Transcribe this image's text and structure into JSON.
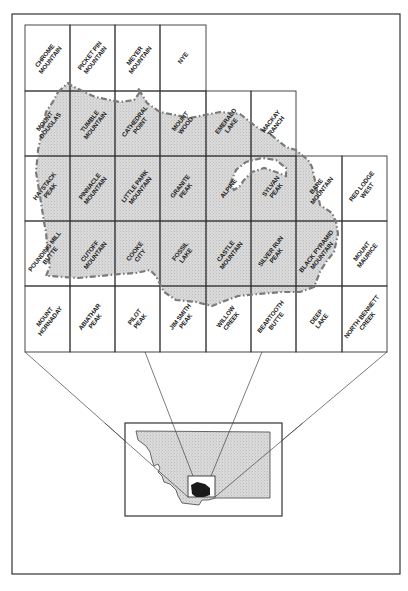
{
  "figure": {
    "outer_frame": {
      "x": 12,
      "y": 14,
      "w": 388,
      "h": 560
    },
    "colors": {
      "line": "#333333",
      "shade": "#d6d6d6",
      "boundary": "#7a7a7a",
      "highlight": "#1a1a1a",
      "paper": "#ffffff"
    }
  },
  "grid": {
    "col_x": [
      25,
      70,
      115,
      160,
      206,
      251,
      296,
      342,
      387
    ],
    "row_y": [
      25,
      91,
      156,
      221,
      286,
      352
    ],
    "cells": [
      {
        "row": 0,
        "col": 0,
        "lines": [
          "CHROME",
          "MOUNTAIN"
        ]
      },
      {
        "row": 0,
        "col": 1,
        "lines": [
          "PICKET PIN",
          "MOUNTAIN"
        ]
      },
      {
        "row": 0,
        "col": 2,
        "lines": [
          "MEYER",
          "MOUNTAIN"
        ]
      },
      {
        "row": 0,
        "col": 3,
        "lines": [
          "NYE"
        ]
      },
      {
        "row": 1,
        "col": 0,
        "lines": [
          "MOUNT",
          "DOUGLAS"
        ]
      },
      {
        "row": 1,
        "col": 1,
        "lines": [
          "TUMBLE",
          "MOUNTAIN"
        ]
      },
      {
        "row": 1,
        "col": 2,
        "lines": [
          "CATHEDRAL",
          "POINT"
        ]
      },
      {
        "row": 1,
        "col": 3,
        "lines": [
          "MOUNT",
          "WOOD"
        ]
      },
      {
        "row": 1,
        "col": 4,
        "lines": [
          "EMERALD",
          "LAKE"
        ]
      },
      {
        "row": 1,
        "col": 5,
        "lines": [
          "MACKAY",
          "RANCH"
        ]
      },
      {
        "row": 2,
        "col": 0,
        "lines": [
          "HAYSTACK",
          "PEAK"
        ]
      },
      {
        "row": 2,
        "col": 1,
        "lines": [
          "PINNACLE",
          "MOUNTAIN"
        ]
      },
      {
        "row": 2,
        "col": 2,
        "lines": [
          "LITTLE PARK",
          "MOUNTAIN"
        ]
      },
      {
        "row": 2,
        "col": 3,
        "lines": [
          "GRANITE",
          "PEAK"
        ]
      },
      {
        "row": 2,
        "col": 4,
        "lines": [
          "ALPINE"
        ]
      },
      {
        "row": 2,
        "col": 5,
        "lines": [
          "SYLVAN",
          "PEAK"
        ]
      },
      {
        "row": 2,
        "col": 6,
        "lines": [
          "BARE",
          "MOUNTAIN"
        ]
      },
      {
        "row": 2,
        "col": 7,
        "lines": [
          "RED LODGE",
          "WEST"
        ]
      },
      {
        "row": 3,
        "col": 0,
        "lines": [
          "POUNDING MILL",
          "BUTTE"
        ]
      },
      {
        "row": 3,
        "col": 1,
        "lines": [
          "CUTOFF",
          "MOUNTAIN"
        ]
      },
      {
        "row": 3,
        "col": 2,
        "lines": [
          "COOKE",
          "CITY"
        ]
      },
      {
        "row": 3,
        "col": 3,
        "lines": [
          "FOSSIL",
          "LAKE"
        ]
      },
      {
        "row": 3,
        "col": 4,
        "lines": [
          "CASTLE",
          "MOUNTAIN"
        ]
      },
      {
        "row": 3,
        "col": 5,
        "lines": [
          "SILVER RUN",
          "PEAK"
        ]
      },
      {
        "row": 3,
        "col": 6,
        "lines": [
          "BLACK PYRAMID",
          "MOUNTAIN"
        ]
      },
      {
        "row": 3,
        "col": 7,
        "lines": [
          "MOUNT",
          "MAURICE"
        ]
      },
      {
        "row": 4,
        "col": 0,
        "lines": [
          "MOUNT",
          "HORNADAY"
        ]
      },
      {
        "row": 4,
        "col": 1,
        "lines": [
          "ABIATHAR",
          "PEAK"
        ]
      },
      {
        "row": 4,
        "col": 2,
        "lines": [
          "PILOT",
          "PEAK"
        ]
      },
      {
        "row": 4,
        "col": 3,
        "lines": [
          "JIM SMITH",
          "PEAK"
        ]
      },
      {
        "row": 4,
        "col": 4,
        "lines": [
          "WILLOW",
          "CREEK"
        ]
      },
      {
        "row": 4,
        "col": 5,
        "lines": [
          "BEARTOOTH",
          "BUTTE"
        ]
      },
      {
        "row": 4,
        "col": 6,
        "lines": [
          "DEEP",
          "LAKE"
        ]
      },
      {
        "row": 4,
        "col": 7,
        "lines": [
          "NORTH BENNETT",
          "CREEK"
        ]
      }
    ]
  },
  "study_area": {
    "description": "Shaded area enclosed by dash-dot boundary line",
    "points": "58,92 68,83 72,86 95,97 120,102 134,100 140,92 138,88 147,103 160,112 190,118 220,112 240,114 258,128 270,134 286,147 296,150 303,156 308,160 312,167 314,176 320,205 332,213 336,222 338,234 334,252 326,262 320,272 314,287 300,292 282,292 258,294 238,296 222,302 212,306 196,302 176,300 170,296 164,292 160,284 156,276 150,270 136,273 120,274 100,276 78,278 50,276 46,276 50,266 48,256 46,232 44,222 40,196 36,172 38,150 42,132 46,112 54,100",
    "inclusion": "230,184 236,170 246,162 262,158 276,160 286,168 286,176 276,172 264,168 252,172 244,180 240,186 234,190"
  },
  "inset": {
    "frame": {
      "x": 125,
      "y": 423,
      "w": 157,
      "h": 93
    },
    "state_name_visible": false,
    "state_outline": "136,431 270,432 270,498 229,498 216,498 208,500 202,500 199,505 182,503 178,496 176,490 170,484 164,482 162,476 158,472 160,468 158,464 154,466 152,460 150,452 146,446 138,440",
    "locator_box": {
      "x": 188,
      "y": 476,
      "w": 27,
      "h": 21
    },
    "study_area_blob": "191,485 197,482 205,484 210,488 210,495 204,497 196,497 192,494"
  },
  "leader_lines": [
    {
      "from": [
        25,
        352
      ],
      "to": [
        188,
        497
      ]
    },
    {
      "from": [
        145,
        352
      ],
      "to": [
        193,
        476
      ]
    },
    {
      "from": [
        262,
        352
      ],
      "to": [
        211,
        476
      ]
    },
    {
      "from": [
        387,
        352
      ],
      "to": [
        215,
        497
      ]
    }
  ]
}
